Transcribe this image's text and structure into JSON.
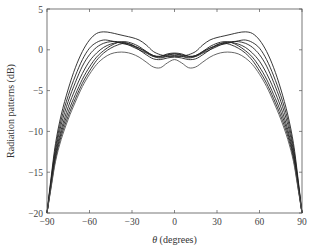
{
  "chart_data": {
    "type": "line",
    "title": "",
    "xlabel": "θ (degrees)",
    "ylabel": "Radiation patterns (dB)",
    "xlim": [
      -90,
      90
    ],
    "ylim": [
      -20,
      5
    ],
    "xticks": [
      -90,
      -60,
      -30,
      0,
      30,
      60,
      90
    ],
    "yticks": [
      -20,
      -15,
      -10,
      -5,
      0,
      5
    ],
    "grid": false,
    "legend": null,
    "x": [
      -90,
      -87,
      -84,
      -80,
      -75,
      -70,
      -65,
      -60,
      -55,
      -50,
      -45,
      -40,
      -35,
      -30,
      -25,
      -20,
      -15,
      -10,
      -5,
      0,
      5,
      10,
      15,
      20,
      25,
      30,
      35,
      40,
      45,
      50,
      55,
      60,
      65,
      70,
      75,
      80,
      84,
      87,
      90
    ],
    "series": [
      {
        "name": "pattern 1",
        "values": [
          -20,
          -15.5,
          -11.5,
          -8.0,
          -4.8,
          -2.2,
          -0.2,
          1.2,
          2.0,
          2.2,
          2.1,
          1.9,
          1.7,
          1.5,
          1.2,
          0.6,
          -0.2,
          -0.6,
          -0.8,
          -0.8,
          -0.8,
          -0.6,
          -0.2,
          0.6,
          1.2,
          1.5,
          1.7,
          1.9,
          2.1,
          2.2,
          2.0,
          1.2,
          -0.2,
          -2.2,
          -4.8,
          -8.0,
          -11.5,
          -15.5,
          -20
        ]
      },
      {
        "name": "pattern 2",
        "values": [
          -20,
          -15.8,
          -12.0,
          -8.6,
          -5.6,
          -3.2,
          -1.2,
          0.2,
          0.9,
          1.2,
          1.1,
          0.9,
          0.7,
          0.5,
          0.2,
          -0.2,
          -0.7,
          -0.9,
          -0.7,
          -0.5,
          -0.7,
          -0.9,
          -0.7,
          -0.2,
          0.2,
          0.5,
          0.7,
          0.9,
          1.1,
          1.2,
          0.9,
          0.2,
          -1.2,
          -3.2,
          -5.6,
          -8.6,
          -12.0,
          -15.8,
          -20
        ]
      },
      {
        "name": "pattern 3",
        "values": [
          -20,
          -16.0,
          -12.4,
          -9.2,
          -6.3,
          -4.0,
          -2.0,
          -0.6,
          0.3,
          0.8,
          1.0,
          1.0,
          0.8,
          0.4,
          0.0,
          -0.4,
          -0.8,
          -0.8,
          -0.5,
          -0.4,
          -0.5,
          -0.8,
          -0.8,
          -0.4,
          0.0,
          0.4,
          0.8,
          1.0,
          1.0,
          0.8,
          0.3,
          -0.6,
          -2.0,
          -4.0,
          -6.3,
          -9.2,
          -12.4,
          -16.0,
          -20
        ]
      },
      {
        "name": "pattern 4",
        "values": [
          -20,
          -16.2,
          -12.8,
          -9.8,
          -7.0,
          -4.8,
          -2.9,
          -1.4,
          -0.4,
          0.3,
          0.7,
          0.9,
          0.9,
          0.6,
          0.2,
          -0.3,
          -0.7,
          -0.8,
          -0.6,
          -0.5,
          -0.6,
          -0.8,
          -0.7,
          -0.3,
          0.2,
          0.6,
          0.9,
          0.9,
          0.7,
          0.3,
          -0.4,
          -1.4,
          -2.9,
          -4.8,
          -7.0,
          -9.8,
          -12.8,
          -16.2,
          -20
        ]
      },
      {
        "name": "pattern 5",
        "values": [
          -20,
          -16.4,
          -13.1,
          -10.2,
          -7.6,
          -5.5,
          -3.6,
          -2.1,
          -0.9,
          -0.1,
          0.5,
          0.9,
          1.0,
          0.8,
          0.4,
          -0.2,
          -0.8,
          -1.0,
          -0.8,
          -0.7,
          -0.8,
          -1.0,
          -0.8,
          -0.2,
          0.4,
          0.8,
          1.0,
          0.9,
          0.5,
          -0.1,
          -0.9,
          -2.1,
          -3.6,
          -5.5,
          -7.6,
          -10.2,
          -13.1,
          -16.4,
          -20
        ]
      },
      {
        "name": "pattern 6",
        "values": [
          -20,
          -16.6,
          -13.4,
          -10.6,
          -8.1,
          -6.0,
          -4.1,
          -2.6,
          -1.3,
          -0.4,
          0.2,
          0.6,
          0.8,
          0.6,
          0.0,
          -0.6,
          -1.1,
          -1.2,
          -1.0,
          -0.9,
          -1.0,
          -1.2,
          -1.1,
          -0.6,
          0.0,
          0.6,
          0.8,
          0.6,
          0.2,
          -0.4,
          -1.3,
          -2.6,
          -4.1,
          -6.0,
          -8.1,
          -10.6,
          -13.4,
          -16.6,
          -20
        ]
      },
      {
        "name": "pattern 7",
        "values": [
          -20,
          -16.8,
          -13.7,
          -11.0,
          -8.5,
          -6.4,
          -4.5,
          -3.0,
          -1.8,
          -1.0,
          -0.5,
          -0.3,
          -0.3,
          -0.5,
          -0.9,
          -1.5,
          -2.1,
          -2.2,
          -1.6,
          -1.2,
          -1.6,
          -2.2,
          -2.1,
          -1.5,
          -0.9,
          -0.5,
          -0.3,
          -0.3,
          -0.5,
          -1.0,
          -1.8,
          -3.0,
          -4.5,
          -6.4,
          -8.5,
          -11.0,
          -13.7,
          -16.8,
          -20
        ]
      }
    ]
  },
  "axes": {
    "xlabel_prefix": "θ",
    "xlabel_suffix": " (degrees)",
    "ylabel": "Radiation patterns (dB)",
    "xtick_labels": [
      "−90",
      "−60",
      "−30",
      "0",
      "30",
      "60",
      "90"
    ],
    "ytick_labels": [
      "−20",
      "−15",
      "−10",
      "−5",
      "0",
      "5"
    ]
  }
}
